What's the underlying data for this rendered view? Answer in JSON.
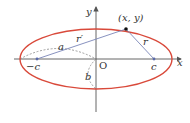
{
  "diagram": {
    "type": "ellipse-foci",
    "colors": {
      "ellipse": "#d9493a",
      "axes": "#555555",
      "segments": "#7b86b8",
      "dashed": "#888888",
      "point": "#111111",
      "focus": "#5a6aa8"
    },
    "labels": {
      "y_axis": "y",
      "x_axis": "x",
      "origin": "O",
      "point": "(x, y)",
      "r_prime": "r′",
      "r": "r",
      "a": "a",
      "b": "b",
      "neg_c": "−c",
      "c": "c"
    }
  }
}
